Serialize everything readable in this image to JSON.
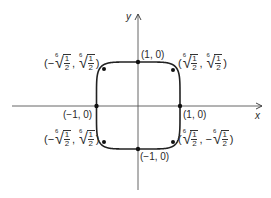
{
  "diagram": {
    "title": "",
    "curve": "x^6 + y^6 = 1",
    "axes": {
      "x_label": "x",
      "y_label": "y"
    },
    "points": {
      "top": "(1, 0)",
      "bottom": "(−1, 0)",
      "left": "(−1, 0)",
      "right": "(1, 0)"
    },
    "corner_labels": {
      "top_left": {
        "open": "(",
        "s1": "−",
        "s2": "",
        "close": ")",
        "index": "6",
        "num": "1",
        "den": "2"
      },
      "top_right": {
        "open": "(",
        "s1": "",
        "s2": "",
        "close": ")",
        "index": "6",
        "num": "1",
        "den": "2"
      },
      "bottom_left": {
        "open": "(",
        "s1": "−",
        "s2": "",
        "close": ")",
        "index": "6",
        "num": "1",
        "den": "2"
      },
      "bottom_right": {
        "open": "(",
        "s1": "",
        "s2": "−",
        "close": ")",
        "index": "6",
        "num": "1",
        "den": "2"
      }
    },
    "colors": {
      "ink": "#222222",
      "background": "#ffffff"
    }
  }
}
